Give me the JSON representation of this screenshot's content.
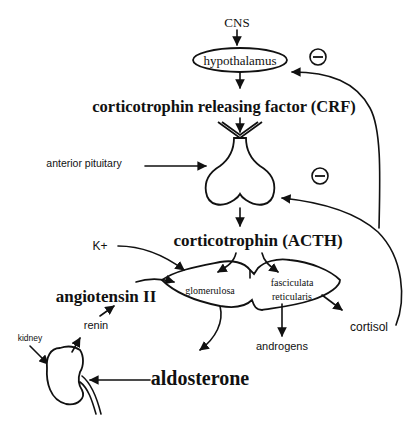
{
  "diagram": {
    "nodes": {
      "cns": "CNS",
      "hypothalamus": "hypothalamus",
      "crf": "corticotrophin releasing factor (CRF)",
      "anterior_pituitary": "anterior pituitary",
      "acth": "corticotrophin (ACTH)",
      "k_plus": "K+",
      "glomerulosa": "glomerulosa",
      "fasciculata": "fasciculata",
      "reticularis": "reticularis",
      "angiotensin": "angiotensin II",
      "renin": "renin",
      "kidney": "kidney",
      "cortisol": "cortisol",
      "androgens": "androgens",
      "aldosterone": "aldosterone"
    },
    "feedback": {
      "hypothalamus_inhibit": "−",
      "pituitary_inhibit": "−"
    }
  }
}
